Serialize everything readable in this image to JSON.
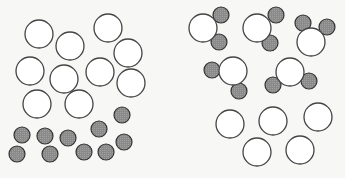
{
  "diagram": {
    "colors": {
      "background": "#f7f7f5",
      "large_fill": "#ffffff",
      "large_stroke": "#444444",
      "small_fill": "#8a8a8a",
      "small_stroke": "#333333"
    },
    "radii": {
      "large": 14,
      "small": 8
    },
    "left_panel": {
      "large_atoms": [
        [
          39,
          34
        ],
        [
          70,
          46
        ],
        [
          108,
          28
        ],
        [
          128,
          53
        ],
        [
          30,
          71
        ],
        [
          64,
          79
        ],
        [
          100,
          72
        ],
        [
          131,
          83
        ],
        [
          37,
          104
        ],
        [
          79,
          104
        ]
      ],
      "small_atoms": [
        [
          122,
          115
        ],
        [
          99,
          129
        ],
        [
          22,
          135
        ],
        [
          45,
          136
        ],
        [
          68,
          138
        ],
        [
          124,
          142
        ],
        [
          17,
          154
        ],
        [
          50,
          154
        ],
        [
          84,
          152
        ],
        [
          106,
          152
        ]
      ]
    },
    "right_panel": {
      "molecules": [
        {
          "center": [
            203,
            28
          ],
          "attached": [
            [
              221,
              15
            ],
            [
              219,
              42
            ]
          ]
        },
        {
          "center": [
            257,
            28
          ],
          "attached": [
            [
              276,
              15
            ],
            [
              270,
              43
            ]
          ]
        },
        {
          "center": [
            311,
            42
          ],
          "attached": [
            [
              303,
              23
            ],
            [
              327,
              27
            ]
          ]
        },
        {
          "center": [
            233,
            71
          ],
          "attached": [
            [
              212,
              70
            ],
            [
              239,
              91
            ]
          ]
        },
        {
          "center": [
            290,
            72
          ],
          "attached": [
            [
              273,
              85
            ],
            [
              309,
              81
            ]
          ]
        }
      ],
      "free_large_atoms": [
        [
          230,
          124
        ],
        [
          273,
          121
        ],
        [
          318,
          117
        ],
        [
          257,
          152
        ],
        [
          300,
          150
        ]
      ]
    }
  }
}
